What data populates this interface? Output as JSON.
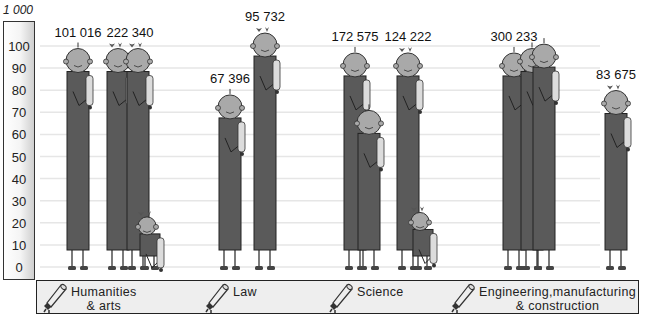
{
  "chart_data": {
    "type": "bar",
    "title": "",
    "scale_unit_label": "1 000",
    "xlabel": "",
    "ylabel": "",
    "ylim": [
      0,
      100
    ],
    "yticks": [
      100,
      90,
      80,
      70,
      60,
      50,
      40,
      30,
      20,
      10,
      0
    ],
    "grid": true,
    "legend_position": "bottom",
    "categories": [
      "Humanities\n& arts",
      "Law",
      "Science",
      "Engineering,manufacturing\n& construction"
    ],
    "groups": [
      {
        "category": "Humanities\n& arts",
        "icon": "diploma-scroll-icon",
        "figures": [
          {
            "gender": "male",
            "value": 88,
            "count_label": "101 016",
            "figure": "man"
          },
          {
            "gender": "female",
            "value": 88,
            "count_label": "222 340",
            "figure": "woman"
          },
          {
            "gender": "female",
            "value": 88,
            "count_label": "",
            "figure": "woman"
          },
          {
            "gender": "female",
            "value": 10,
            "count_label": "",
            "figure": "small-girl"
          }
        ]
      },
      {
        "category": "Law",
        "icon": "diploma-scroll-icon",
        "figures": [
          {
            "gender": "male",
            "value": 67,
            "count_label": "67 396",
            "figure": "man"
          },
          {
            "gender": "female",
            "value": 95,
            "count_label": "95 732",
            "figure": "woman"
          }
        ]
      },
      {
        "category": "Science",
        "icon": "diploma-scroll-icon",
        "figures": [
          {
            "gender": "male",
            "value": 86,
            "count_label": "172 575",
            "figure": "man"
          },
          {
            "gender": "male",
            "value": 60,
            "count_label": "",
            "figure": "man"
          },
          {
            "gender": "female",
            "value": 86,
            "count_label": "124 222",
            "figure": "woman"
          },
          {
            "gender": "female",
            "value": 12,
            "count_label": "",
            "figure": "small-girl"
          }
        ]
      },
      {
        "category": "Engineering,manufacturing\n& construction",
        "icon": "diploma-scroll-icon",
        "figures": [
          {
            "gender": "male",
            "value": 86,
            "count_label": "300 233",
            "figure": "man"
          },
          {
            "gender": "male",
            "value": 88,
            "count_label": "",
            "figure": "man"
          },
          {
            "gender": "male",
            "value": 90,
            "count_label": "",
            "figure": "man"
          },
          {
            "gender": "female",
            "value": 69,
            "count_label": "83 675",
            "figure": "woman"
          }
        ]
      }
    ],
    "colors": {
      "body": "#5a5a5a",
      "head": "#a9a9a9",
      "bow": "#555555",
      "gridline": "#e6e6e6"
    }
  }
}
